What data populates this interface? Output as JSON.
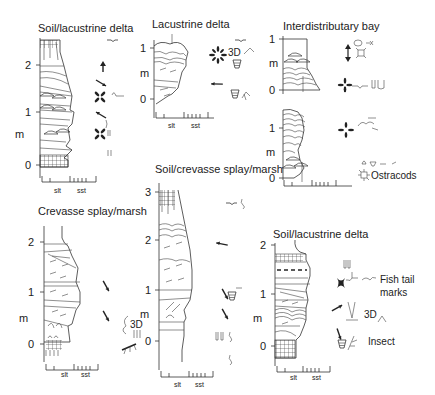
{
  "figure": {
    "panels": [
      {
        "id": "soil-lacustrine-delta-1",
        "title": "Soil/lacustrine delta",
        "y_unit": "m",
        "y_ticks": [
          "0",
          "1",
          "2"
        ],
        "x_labels": [
          "slt",
          "sst"
        ],
        "annotations": []
      },
      {
        "id": "lacustrine-delta",
        "title": "Lacustrine delta",
        "y_unit": "m",
        "y_ticks": [
          "0",
          "1"
        ],
        "x_labels": [
          "slt",
          "sst"
        ],
        "annotations": [
          "3D"
        ]
      },
      {
        "id": "interdistributary-bay",
        "title": "Interdistributary bay",
        "y_unit": "m",
        "y_ticks_upper": [
          "0",
          "1"
        ],
        "y_ticks_lower": [
          "0",
          "1"
        ],
        "x_labels": [
          "slt",
          "sst"
        ],
        "annotations": [
          "Ostracods"
        ]
      },
      {
        "id": "crevasse-splay-marsh",
        "title": "Crevasse splay/marsh",
        "y_unit": "m",
        "y_ticks": [
          "0",
          "1",
          "2"
        ],
        "x_labels": [
          "slt",
          "sst"
        ],
        "annotations": [
          "3D"
        ]
      },
      {
        "id": "soil-crevasse-splay-marsh",
        "title": "Soil/crevasse splay/marsh",
        "y_unit": "m",
        "y_ticks": [
          "0",
          "1",
          "2",
          "3"
        ],
        "x_labels": [
          "slt",
          "sst"
        ],
        "annotations": []
      },
      {
        "id": "soil-lacustrine-delta-2",
        "title": "Soil/lacustrine delta",
        "y_unit": "m",
        "y_ticks": [
          "0",
          "1",
          "2"
        ],
        "x_labels": [
          "slt",
          "sst"
        ],
        "annotations": [
          "Fish tail",
          "marks",
          "3D",
          "Insect"
        ]
      }
    ]
  }
}
